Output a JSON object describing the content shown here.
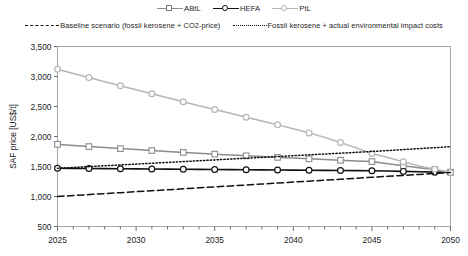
{
  "chart_data": {
    "type": "line",
    "title": "",
    "xlabel": "",
    "ylabel": "SAF price [US$/t]",
    "xlim": [
      2025,
      2050
    ],
    "ylim": [
      500,
      3500
    ],
    "ytick_labels": [
      "3,500",
      "3,000",
      "2,500",
      "2,000",
      "1,500",
      "1,000",
      "500"
    ],
    "ytick_values": [
      3500,
      3000,
      2500,
      2000,
      1500,
      1000,
      500
    ],
    "xtick_labels": [
      "2025",
      "2030",
      "2035",
      "2040",
      "2045",
      "2050"
    ],
    "xtick_values": [
      2025,
      2030,
      2035,
      2040,
      2045,
      2050
    ],
    "minor_xticks_every": 1,
    "grid": false,
    "legend_position": "top",
    "x": [
      2025,
      2026,
      2027,
      2028,
      2029,
      2030,
      2031,
      2032,
      2033,
      2034,
      2035,
      2036,
      2037,
      2038,
      2039,
      2040,
      2041,
      2042,
      2043,
      2044,
      2045,
      2046,
      2047,
      2048,
      2049,
      2050
    ],
    "series": [
      {
        "name": "ABtL",
        "marker": "square",
        "line_style": "solid",
        "color": "#8c8c8c",
        "values": [
          1870,
          1850,
          1832,
          1815,
          1798,
          1782,
          1766,
          1750,
          1735,
          1720,
          1706,
          1692,
          1678,
          1665,
          1652,
          1640,
          1628,
          1616,
          1604,
          1593,
          1582,
          1545,
          1512,
          1480,
          1448,
          1405
        ]
      },
      {
        "name": "HEFA",
        "marker": "circle",
        "line_style": "solid",
        "color": "#111111",
        "values": [
          1470,
          1468,
          1466,
          1464,
          1462,
          1460,
          1458,
          1456,
          1454,
          1452,
          1450,
          1448,
          1446,
          1444,
          1442,
          1440,
          1438,
          1436,
          1434,
          1432,
          1430,
          1424,
          1418,
          1412,
          1406,
          1400
        ]
      },
      {
        "name": "PtL",
        "marker": "circle",
        "line_style": "solid",
        "color": "#b5b5b5",
        "values": [
          3120,
          3050,
          2982,
          2914,
          2846,
          2778,
          2712,
          2646,
          2580,
          2514,
          2450,
          2386,
          2322,
          2258,
          2194,
          2130,
          2060,
          1985,
          1900,
          1810,
          1716,
          1650,
          1580,
          1510,
          1455,
          1400
        ]
      },
      {
        "name": "Baseline scenario (fossil kerosene + CO2-price)",
        "marker": "none",
        "line_style": "dashed",
        "color": "#111111",
        "values": [
          1000,
          1016,
          1032,
          1048,
          1064,
          1080,
          1096,
          1112,
          1128,
          1144,
          1160,
          1176,
          1192,
          1208,
          1224,
          1240,
          1256,
          1272,
          1288,
          1304,
          1320,
          1336,
          1352,
          1368,
          1384,
          1400
        ]
      },
      {
        "name": "Fossil kerosene + actual environmental impact costs",
        "marker": "none",
        "line_style": "dotted",
        "color": "#111111",
        "values": [
          1470,
          1484,
          1498,
          1512,
          1526,
          1540,
          1554,
          1568,
          1582,
          1596,
          1610,
          1624,
          1638,
          1652,
          1666,
          1680,
          1694,
          1708,
          1722,
          1736,
          1750,
          1766,
          1782,
          1798,
          1814,
          1830
        ]
      }
    ]
  },
  "legend": {
    "row1": [
      {
        "label": "ABtL",
        "key": "square-marker-line"
      },
      {
        "label": "HEFA",
        "key": "circle-marker-line"
      },
      {
        "label": "PtL",
        "key": "circle-marker-light-line"
      }
    ],
    "row2": [
      {
        "label": "Baseline scenario (fossil kerosene + CO2-price)",
        "key": "dashed-line"
      },
      {
        "label": "Fossil kerosene + actual environmental impact costs",
        "key": "dotted-line"
      }
    ]
  }
}
